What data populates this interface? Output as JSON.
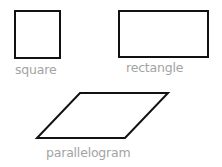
{
  "diagram": {
    "title": "",
    "stroke_color": "#111111",
    "label_color": "#a3a3a3",
    "shapes": [
      {
        "id": "square",
        "kind": "square",
        "label": "square",
        "points": [
          [
            15,
            11
          ],
          [
            60,
            11
          ],
          [
            60,
            58
          ],
          [
            15,
            58
          ]
        ],
        "label_pos": [
          15,
          64
        ]
      },
      {
        "id": "rectangle",
        "kind": "rectangle",
        "label": "rectangle",
        "points": [
          [
            119,
            11
          ],
          [
            208,
            11
          ],
          [
            208,
            57
          ],
          [
            119,
            57
          ]
        ],
        "label_pos": [
          126,
          62
        ]
      },
      {
        "id": "parallelogram",
        "kind": "parallelogram",
        "label": "parallelogram",
        "points": [
          [
            80,
            93
          ],
          [
            168,
            93
          ],
          [
            125,
            138
          ],
          [
            37,
            138
          ]
        ],
        "label_pos": [
          46,
          147
        ]
      }
    ]
  }
}
